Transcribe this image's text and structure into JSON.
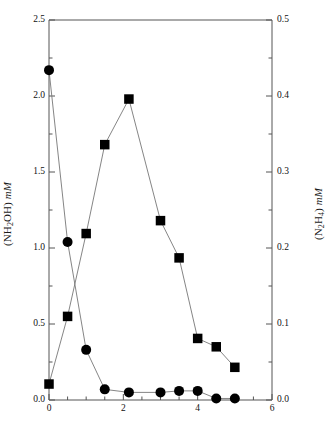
{
  "chart_data": {
    "type": "line",
    "title": "",
    "xlabel": "",
    "ylabel": "(NH2OH) mM",
    "ylabel_right": "(N2H4) mM",
    "xlim": [
      0,
      6
    ],
    "ylim": [
      0,
      2.5
    ],
    "ylim_right": [
      0,
      0.5
    ],
    "grid": false,
    "legend": "none",
    "x_ticks": [
      0,
      2,
      4,
      6
    ],
    "x_tick_labels": [
      "0",
      "2",
      "4",
      "6"
    ],
    "x_minor_ticks": [
      0.5,
      1,
      1.5,
      2.5,
      3,
      3.5,
      4.5,
      5,
      5.5
    ],
    "y_ticks_left": [
      0.0,
      0.5,
      1.0,
      1.5,
      2.0,
      2.5
    ],
    "y_tick_labels_left": [
      "0.0",
      "0.5",
      "1.0",
      "1.5",
      "2.0",
      "2.5"
    ],
    "y_minor_ticks_left": [
      0.25,
      0.75,
      1.25,
      1.75,
      2.25
    ],
    "y_ticks_right": [
      0.0,
      0.1,
      0.2,
      0.3,
      0.4,
      0.5
    ],
    "y_tick_labels_right": [
      "0.0",
      "0.1",
      "0.2",
      "0.3",
      "0.4",
      "0.5"
    ],
    "y_minor_ticks_right": [
      0.05,
      0.15,
      0.25,
      0.35,
      0.45
    ],
    "series": [
      {
        "name": "(NH2OH) mM",
        "marker": "circle",
        "axis": "left",
        "x": [
          0,
          0.5,
          1.0,
          1.5,
          2.15,
          3.0,
          3.5,
          4.0,
          4.5,
          5.0
        ],
        "values": [
          2.17,
          1.04,
          0.33,
          0.07,
          0.05,
          0.05,
          0.06,
          0.06,
          0.01,
          0.01
        ]
      },
      {
        "name": "(N2H4) mM",
        "marker": "square",
        "axis": "right",
        "x": [
          0,
          0.5,
          1.0,
          1.5,
          2.15,
          3.0,
          3.5,
          4.0,
          4.5,
          5.0
        ],
        "values": [
          0.021,
          0.11,
          0.219,
          0.336,
          0.396,
          0.236,
          0.187,
          0.081,
          0.07,
          0.043
        ]
      }
    ],
    "colors": {
      "marker": "#000000",
      "line": "#777777",
      "axis": "#555555",
      "background": "#ffffff"
    }
  },
  "labels": {
    "y_left_prefix": "(NH",
    "y_left_sub": "2",
    "y_left_mid": "OH) ",
    "y_left_unit": "mM",
    "y_right_p1": "(N",
    "y_right_s1": "2",
    "y_right_p2": "H",
    "y_right_s2": "4",
    "y_right_p3": ") ",
    "y_right_unit": "mM"
  }
}
